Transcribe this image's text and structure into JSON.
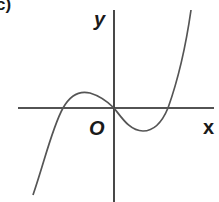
{
  "figure": {
    "panel_label": "c)",
    "axis_labels": {
      "y": "y",
      "x": "x",
      "origin": "O"
    },
    "colors": {
      "axes": "#1a1a1a",
      "curve": "#555555",
      "background": "#ffffff"
    },
    "curve": {
      "description": "cubic curve passing through origin with three x-intercepts",
      "roots": [
        "negative root",
        "O",
        "positive root"
      ],
      "local_max": "left of y-axis, above x-axis",
      "local_min": "right of y-axis, below x-axis"
    }
  }
}
